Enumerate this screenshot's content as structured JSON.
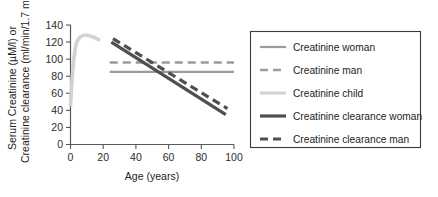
{
  "chart_data": {
    "type": "line",
    "title": "",
    "xlabel": "Age (years)",
    "ylabel_line1": "Serum Creatinine (µM/l) or",
    "ylabel_line2": "Creatinine clearance (ml/min/1.7 m²)",
    "xlim": [
      0,
      100
    ],
    "ylim": [
      0,
      140
    ],
    "xticks": [
      0,
      20,
      40,
      60,
      80,
      100
    ],
    "yticks": [
      0,
      20,
      40,
      60,
      80,
      100,
      120,
      140
    ],
    "grid": false,
    "legend_position": "right-outside",
    "series": [
      {
        "name": "Creatinine woman",
        "style": "solid",
        "color": "#9b9b9b",
        "width": 2.2,
        "points": [
          [
            24,
            85
          ],
          [
            100,
            85
          ]
        ]
      },
      {
        "name": "Creatinine man",
        "style": "dashed",
        "color": "#9b9b9b",
        "width": 2.6,
        "points": [
          [
            24,
            96
          ],
          [
            100,
            96
          ]
        ]
      },
      {
        "name": "Creatinine child",
        "style": "solid",
        "color": "#d2d2d2",
        "width": 3.6,
        "points": [
          [
            0,
            45
          ],
          [
            1,
            78
          ],
          [
            2,
            100
          ],
          [
            3,
            114
          ],
          [
            4,
            121
          ],
          [
            6,
            126
          ],
          [
            8,
            128
          ],
          [
            10,
            128
          ],
          [
            12,
            127
          ],
          [
            14,
            126
          ],
          [
            16,
            124
          ],
          [
            18,
            122
          ]
        ]
      },
      {
        "name": "Creatinine clearance woman",
        "style": "solid",
        "color": "#4f4f4f",
        "width": 3.2,
        "points": [
          [
            25,
            120
          ],
          [
            95,
            35
          ]
        ]
      },
      {
        "name": "Creatinine clearance man",
        "style": "dashed",
        "color": "#4f4f4f",
        "width": 3.2,
        "points": [
          [
            26,
            124
          ],
          [
            96,
            42
          ]
        ]
      }
    ]
  },
  "legend": {
    "items": [
      {
        "label": "Creatinine woman",
        "style": "solid",
        "color": "#9b9b9b",
        "width": 2.2
      },
      {
        "label": "Creatinine man",
        "style": "dashed",
        "color": "#9b9b9b",
        "width": 2.6
      },
      {
        "label": "Creatinine child",
        "style": "solid",
        "color": "#d2d2d2",
        "width": 3.0
      },
      {
        "label": "Creatinine clearance woman",
        "style": "solid",
        "color": "#4f4f4f",
        "width": 3.2
      },
      {
        "label": "Creatinine clearance man",
        "style": "dashed",
        "color": "#4f4f4f",
        "width": 3.2
      }
    ]
  }
}
